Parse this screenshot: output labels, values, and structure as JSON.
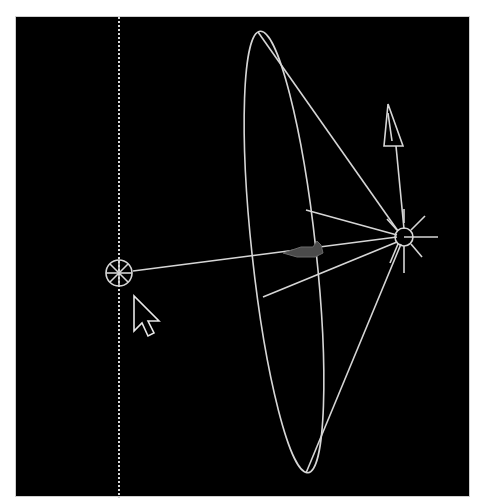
{
  "viewport": {
    "label": "3D viewport - spotlight",
    "background": "#000000",
    "wire_color": "#d6d6d6",
    "dim_color": "#6a6a6a"
  },
  "scene": {
    "spotlight": {
      "name": "Spotlight",
      "position": [
        403,
        236
      ],
      "cone_tip_top": [
        257,
        31
      ],
      "cone_tip_bottom": [
        305,
        472
      ]
    },
    "target": {
      "name": "Spotlight target",
      "position": [
        118,
        272
      ]
    },
    "up_vector": {
      "name": "Up vector",
      "tip": [
        387,
        103
      ]
    },
    "guide_line": {
      "name": "Vertical guide",
      "x": 118
    },
    "cursor": {
      "name": "Mouse pointer",
      "position": [
        133,
        295
      ]
    }
  }
}
